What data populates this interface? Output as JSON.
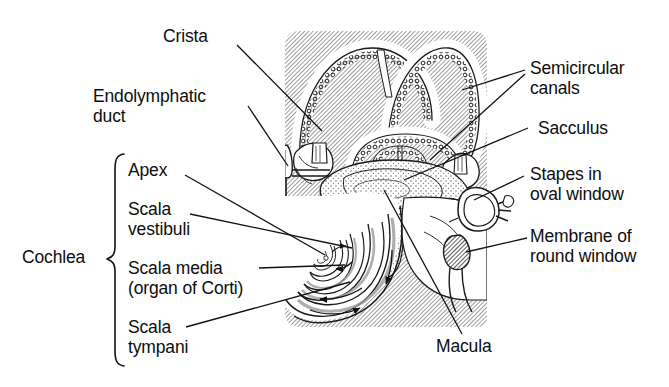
{
  "figure": {
    "style": "black and white line drawing with diagonal hatch shading"
  },
  "colors": {
    "ink": "#0d0d0d",
    "hatch_line": "#8e8e8e",
    "hatch_background": "#ffffff",
    "stipple": "#6f6f6f",
    "leader": "#111111",
    "page_background": "#ffffff"
  },
  "labels": {
    "crista": "Crista",
    "endolymphatic_duct_l1": "Endolymphatic",
    "endolymphatic_duct_l2": "duct",
    "cochlea": "Cochlea",
    "apex": "Apex",
    "scala_vestibuli_l1": "Scala",
    "scala_vestibuli_l2": "vestibuli",
    "scala_media_l1": "Scala media",
    "scala_media_l2": "(organ of Corti)",
    "scala_tympani_l1": "Scala",
    "scala_tympani_l2": "tympani",
    "semicircular_canals_l1": "Semicircular",
    "semicircular_canals_l2": "canals",
    "sacculus": "Sacculus",
    "stapes_l1": "Stapes in",
    "stapes_l2": "oval window",
    "round_window_l1": "Membrane of",
    "round_window_l2": "round window",
    "macula": "Macula"
  },
  "structures": [
    {
      "name": "semicircular-canals",
      "count": 3,
      "region": "upper"
    },
    {
      "name": "crista-ampullaris",
      "count": 2,
      "region": "upper-left and upper-right"
    },
    {
      "name": "utricle-sacculus",
      "region": "center"
    },
    {
      "name": "cochlear-spiral",
      "turns": 2.5,
      "region": "lower-left"
    },
    {
      "name": "stapes-oval-window",
      "region": "right"
    },
    {
      "name": "round-window-membrane",
      "region": "lower-right"
    },
    {
      "name": "endolymphatic-duct-sac",
      "region": "left"
    },
    {
      "name": "macula",
      "region": "center"
    }
  ]
}
